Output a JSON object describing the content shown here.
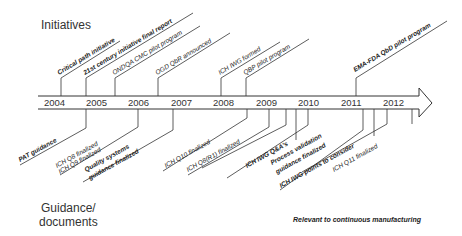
{
  "labels": {
    "initiatives": "Initiatives",
    "guidance_line1": "Guidance/",
    "guidance_line2": "documents",
    "note": "Relevant to continuous manufacturing"
  },
  "years": [
    "2004",
    "2005",
    "2006",
    "2007",
    "2008",
    "2009",
    "2010",
    "2011",
    "2012"
  ],
  "initiatives": [
    {
      "text": "Critical path initiative",
      "x": 61,
      "len": 62,
      "bold": true,
      "year_hint": "2004"
    },
    {
      "text": "21st century initiative final report",
      "x": 86,
      "len": 104,
      "bold": true,
      "year_hint": "2005"
    },
    {
      "text": "ONDQA CMC pilot program",
      "x": 115,
      "len": 85,
      "bold": false,
      "year_hint": "2005"
    },
    {
      "text": "OGD QbR announced",
      "x": 158,
      "len": 72,
      "bold": false,
      "year_hint": "2006"
    },
    {
      "text": "ICH IWG formed",
      "x": 221,
      "len": 60,
      "bold": false,
      "year_hint": "2008"
    },
    {
      "text": "QBP pilot program",
      "x": 246,
      "len": 62,
      "bold": false,
      "year_hint": "2008"
    },
    {
      "text": "EMA-FDA QbD pilot program",
      "x": 356,
      "len": 96,
      "bold": true,
      "year_hint": "2011"
    }
  ],
  "guidance": [
    {
      "text": "PAT guidance",
      "x": 86,
      "bold": true
    },
    {
      "text": "ICH Q8 finalized",
      "x": 86,
      "bold": false
    },
    {
      "text": "ICH Q9 finalized",
      "x": 138,
      "bold": false
    },
    {
      "text": "Quality systems guidance finalized",
      "x": 173,
      "bold": false
    },
    {
      "text": "ICH Q10 finalized",
      "x": 247,
      "bold": false
    },
    {
      "text": "ICH Q8(R1) finalized",
      "x": 269,
      "bold": false
    },
    {
      "text": "ICH IWG Q&A's",
      "x": 286,
      "bold": false
    },
    {
      "text": "Process validation guidance finalized",
      "x": 308,
      "bold": true
    },
    {
      "text": "ICH IWG points to consider",
      "x": 363,
      "bold": false
    },
    {
      "text": "ICH Q11 finalized",
      "x": 387,
      "bold": false
    }
  ]
}
